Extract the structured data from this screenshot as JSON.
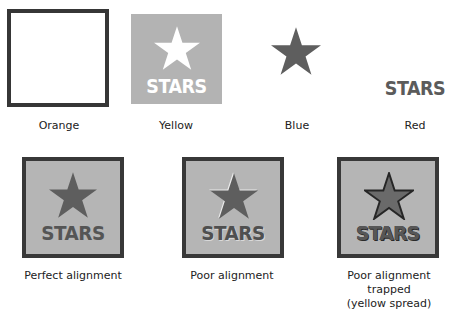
{
  "top_row": {
    "plates": [
      {
        "id": "orange",
        "label": "Orange",
        "content": "empty frame (keyline border)"
      },
      {
        "id": "yellow",
        "label": "Yellow",
        "content": "gray square with knocked-out star and text",
        "text": "STARS"
      },
      {
        "id": "blue",
        "label": "Blue",
        "content": "star"
      },
      {
        "id": "red",
        "label": "Red",
        "content": "text",
        "text": "STARS"
      }
    ]
  },
  "bottom_row": {
    "composites": [
      {
        "id": "perfect",
        "label_lines": [
          "Perfect alignment"
        ],
        "text": "STARS"
      },
      {
        "id": "poor",
        "label_lines": [
          "Poor alignment"
        ],
        "text": "STARS"
      },
      {
        "id": "trapped",
        "label_lines": [
          "Poor alignment",
          "trapped",
          "(yellow spread)"
        ],
        "text": "STARS"
      }
    ]
  },
  "colors": {
    "background": "#ffffff",
    "frame_border": "#363636",
    "plate_fill": "#b3b3b3",
    "star_fill": "#5e5e5e",
    "text_fill": "#555555",
    "knockout": "#ffffff"
  }
}
